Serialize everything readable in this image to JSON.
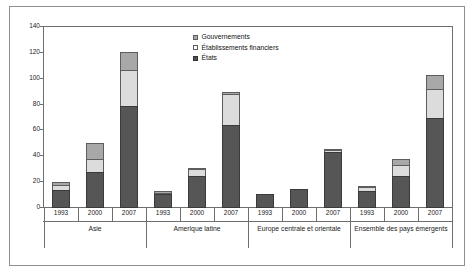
{
  "chart_data": {
    "type": "bar",
    "subtype": "stacked-grouped",
    "title": "",
    "xlabel": "",
    "ylabel": "",
    "ylim": [
      0,
      140
    ],
    "yticks": [
      0,
      20,
      40,
      60,
      80,
      100,
      120,
      140
    ],
    "ytick_labels": [
      "0",
      "20",
      "40",
      "60",
      "80",
      "100",
      "120",
      "140"
    ],
    "grid": false,
    "legend_position": "top-center",
    "legend_entries": [
      "Gouvernements",
      "Établissements financiers",
      "États"
    ],
    "groups": [
      {
        "label": "Asie",
        "categories": [
          "1993",
          "2000",
          "2007"
        ]
      },
      {
        "label": "Amerique latine",
        "categories": [
          "1993",
          "2000",
          "2007"
        ]
      },
      {
        "label": "Europe centrale et orientale",
        "categories": [
          "1993",
          "2000",
          "2007"
        ]
      },
      {
        "label": "Ensemble des pays émergents",
        "categories": [
          "1993",
          "2000",
          "2007"
        ]
      }
    ],
    "series": [
      {
        "name": "États",
        "color": "#565656",
        "values": [
          14,
          28,
          79,
          11,
          25,
          64,
          11,
          15,
          43,
          13,
          25,
          70
        ]
      },
      {
        "name": "Établissements financiers",
        "color": "#dcdcdc",
        "values": [
          4,
          10,
          28,
          1,
          5,
          24,
          0,
          0,
          2,
          3,
          8,
          22
        ]
      },
      {
        "name": "Gouvernements",
        "color": "#a8a8a8",
        "values": [
          2,
          12,
          14,
          1,
          1,
          2,
          0,
          0,
          1,
          1,
          5,
          11
        ]
      }
    ],
    "bar_totals": [
      20,
      50,
      121,
      13,
      31,
      90,
      11,
      15,
      46,
      17,
      38,
      103
    ],
    "flat_categories": [
      "1993",
      "2000",
      "2007",
      "1993",
      "2000",
      "2007",
      "1993",
      "2000",
      "2007",
      "1993",
      "2000",
      "2007"
    ]
  },
  "legend": {
    "items": [
      {
        "label": "Gouvernements"
      },
      {
        "label": "Établissements financiers"
      },
      {
        "label": "États"
      }
    ]
  },
  "axis": {
    "y_labels": [
      "140",
      "120",
      "100",
      "80",
      "60",
      "40",
      "20",
      "0"
    ]
  },
  "groups": [
    {
      "label": "Asie",
      "years": [
        "1993",
        "2000",
        "2007"
      ]
    },
    {
      "label": "Amerique latine",
      "years": [
        "1993",
        "2000",
        "2007"
      ]
    },
    {
      "label": "Europe centrale et orientale",
      "years": [
        "1993",
        "2000",
        "2007"
      ]
    },
    {
      "label": "Ensemble des pays émergents",
      "years": [
        "1993",
        "2000",
        "2007"
      ]
    }
  ]
}
